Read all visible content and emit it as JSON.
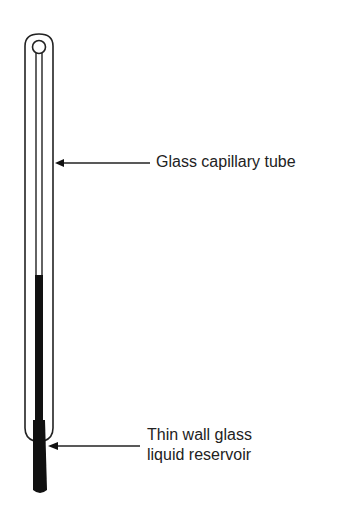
{
  "diagram": {
    "labels": {
      "capillary": "Glass capillary tube",
      "reservoir_line1": "Thin wall glass",
      "reservoir_line2": "liquid reservoir"
    },
    "colors": {
      "stroke": "#222222",
      "liquid": "#111111",
      "background": "#ffffff"
    }
  }
}
